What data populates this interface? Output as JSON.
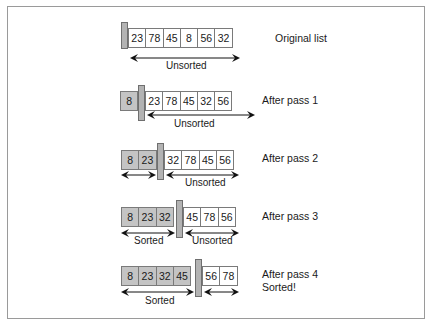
{
  "figure": {
    "rows": [
      {
        "label": "Original list",
        "label2": "",
        "values": [
          "23",
          "78",
          "45",
          "8",
          "56",
          "32"
        ],
        "sorted_count": 0,
        "sorted_label": "",
        "unsorted_label": "Unsorted"
      },
      {
        "label": "After pass 1",
        "label2": "",
        "values": [
          "8",
          "23",
          "78",
          "45",
          "32",
          "56"
        ],
        "sorted_count": 1,
        "sorted_label": "",
        "unsorted_label": "Unsorted"
      },
      {
        "label": "After pass 2",
        "label2": "",
        "values": [
          "8",
          "23",
          "32",
          "78",
          "45",
          "56"
        ],
        "sorted_count": 2,
        "sorted_label": "",
        "unsorted_label": "Unsorted"
      },
      {
        "label": "After pass 3",
        "label2": "",
        "values": [
          "8",
          "23",
          "32",
          "45",
          "78",
          "56"
        ],
        "sorted_count": 3,
        "sorted_label": "Sorted",
        "unsorted_label": "Unsorted"
      },
      {
        "label": "After pass 4",
        "label2": "Sorted!",
        "values": [
          "8",
          "23",
          "32",
          "45",
          "56",
          "78"
        ],
        "sorted_count": 4,
        "sorted_label": "Sorted",
        "unsorted_label": ""
      }
    ]
  },
  "colors": {
    "sorted_fill": "#c4c4c4",
    "wall_fill": "#b3b3b3",
    "cell_border": "#7a7a7a",
    "frame_border": "#9a9a9a"
  }
}
